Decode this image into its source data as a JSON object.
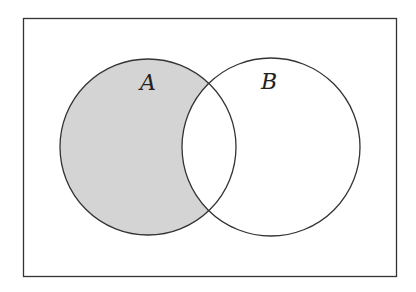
{
  "diagram": {
    "type": "venn",
    "universe": {
      "x": 23,
      "y": 18,
      "width": 373,
      "height": 258,
      "stroke": "#333333"
    },
    "sets": [
      {
        "label": "A",
        "cx": 148,
        "cy": 147,
        "r": 88,
        "label_x": 148,
        "label_y": 90
      },
      {
        "label": "B",
        "cx": 271,
        "cy": 147,
        "r": 89,
        "label_x": 269,
        "label_y": 89
      }
    ],
    "shaded_region": "A minus B",
    "shade_color": "#d4d4d4",
    "stroke_color": "#333333"
  }
}
